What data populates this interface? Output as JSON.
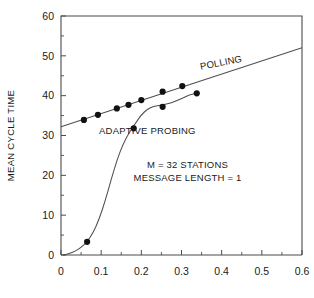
{
  "chart_data": {
    "type": "scatter",
    "title": "",
    "xlabel": "",
    "ylabel": "MEAN CYCLE TIME",
    "xlim": [
      0,
      0.6
    ],
    "ylim": [
      0,
      60
    ],
    "grid": false,
    "legend_position": "inline-annotations",
    "x_ticks": [
      "0",
      "0.1",
      "0.2",
      "0.3",
      "0.4",
      "0.5",
      "0.6"
    ],
    "x_tick_values": [
      0,
      0.1,
      0.2,
      0.3,
      0.4,
      0.5,
      0.6
    ],
    "x_minor_step": 0.05,
    "y_ticks": [
      "0",
      "10",
      "20",
      "30",
      "40",
      "50",
      "60"
    ],
    "y_tick_values": [
      0,
      10,
      20,
      30,
      40,
      50,
      60
    ],
    "y_minor_step": 5,
    "annotations": [
      {
        "name": "polling-label",
        "text": "POLLING",
        "x": 0.4,
        "y": 47.5,
        "rotation": -11
      },
      {
        "name": "adaptive-probing-label",
        "text": "ADAPTIVE PROBING",
        "x": 0.215,
        "y": 30.3,
        "rotation": 0
      },
      {
        "name": "stations-note",
        "text": "M = 32 STATIONS",
        "x": 0.315,
        "y": 21.8,
        "rotation": 0
      },
      {
        "name": "message-length-note",
        "text": "MESSAGE LENGTH = 1",
        "x": 0.315,
        "y": 18.6,
        "rotation": 0
      }
    ],
    "series": [
      {
        "name": "POLLING",
        "kind": "line+markers",
        "line": [
          [
            0.0,
            32.2
          ],
          [
            0.6,
            52.0
          ]
        ],
        "points": [
          [
            0.057,
            33.9
          ],
          [
            0.092,
            35.2
          ],
          [
            0.139,
            36.8
          ],
          [
            0.168,
            37.7
          ],
          [
            0.2,
            38.9
          ],
          [
            0.253,
            41.0
          ],
          [
            0.302,
            42.4
          ]
        ]
      },
      {
        "name": "ADAPTIVE PROBING",
        "kind": "curve+markers",
        "curve": [
          [
            0.005,
            0.0
          ],
          [
            0.02,
            0.3
          ],
          [
            0.035,
            0.9
          ],
          [
            0.05,
            1.9
          ],
          [
            0.065,
            3.3
          ],
          [
            0.08,
            5.6
          ],
          [
            0.095,
            9.0
          ],
          [
            0.11,
            13.6
          ],
          [
            0.125,
            19.0
          ],
          [
            0.14,
            24.0
          ],
          [
            0.155,
            28.0
          ],
          [
            0.17,
            30.8
          ],
          [
            0.185,
            33.0
          ],
          [
            0.2,
            35.2
          ],
          [
            0.215,
            36.6
          ],
          [
            0.23,
            37.3
          ],
          [
            0.25,
            37.6
          ],
          [
            0.275,
            38.2
          ],
          [
            0.3,
            39.3
          ],
          [
            0.32,
            40.2
          ],
          [
            0.338,
            40.6
          ]
        ],
        "points": [
          [
            0.065,
            3.3
          ],
          [
            0.181,
            31.8
          ],
          [
            0.253,
            37.2
          ],
          [
            0.338,
            40.6
          ]
        ]
      }
    ]
  }
}
